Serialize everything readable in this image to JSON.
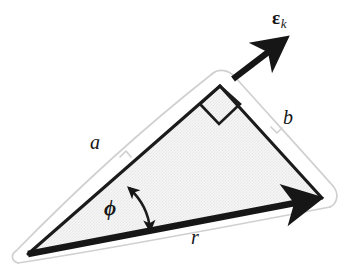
{
  "figure": {
    "kind": "geometry-diagram",
    "background_color": "#ffffff",
    "ink_color": "#161616",
    "fill_color": "#f1f1f1",
    "halo_color": "#cfcfcf"
  },
  "labels": {
    "side_a": "a",
    "side_b": "b",
    "base_r": "r",
    "angle_phi": "ϕ",
    "vector_epsilon": "ε",
    "vector_epsilon_subscript": "k"
  },
  "geometry": {
    "vertex_left": [
      28,
      254
    ],
    "vertex_apex": [
      220,
      86
    ],
    "vertex_right": [
      322,
      198
    ],
    "base_vector_from": [
      28,
      254
    ],
    "base_vector_to": [
      322,
      198
    ],
    "epsilon_vector_from": [
      233,
      79
    ],
    "epsilon_vector_to": [
      290,
      35
    ],
    "right_angle_marker_at": [
      220,
      86
    ],
    "angle_arc_center": [
      28,
      254
    ]
  }
}
